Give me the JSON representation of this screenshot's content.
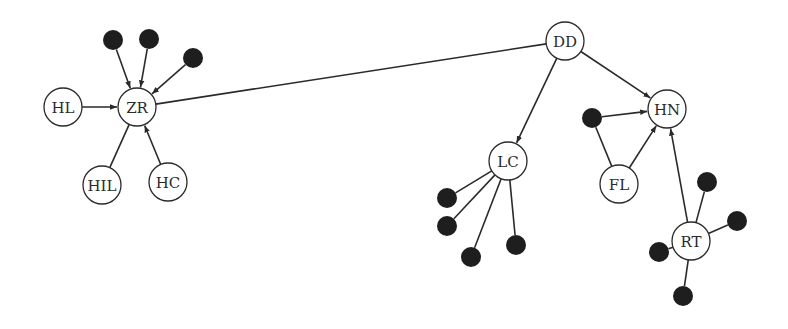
{
  "diagram": {
    "type": "network graph",
    "node_radius": 19,
    "dot_radius": 10,
    "colors": {
      "stroke": "#2a2a2a",
      "dot": "#1e1e1e",
      "background": "#ffffff"
    },
    "labeled_nodes": [
      {
        "id": "ZR",
        "label": "ZR",
        "x": 137,
        "y": 107
      },
      {
        "id": "HL",
        "label": "HL",
        "x": 63,
        "y": 107
      },
      {
        "id": "HIL",
        "label": "HIL",
        "x": 102,
        "y": 185
      },
      {
        "id": "HC",
        "label": "HC",
        "x": 168,
        "y": 182
      },
      {
        "id": "DD",
        "label": "DD",
        "x": 565,
        "y": 41
      },
      {
        "id": "HN",
        "label": "HN",
        "x": 667,
        "y": 109
      },
      {
        "id": "LC",
        "label": "LC",
        "x": 508,
        "y": 161
      },
      {
        "id": "FL",
        "label": "FL",
        "x": 619,
        "y": 184
      },
      {
        "id": "RT",
        "label": "RT",
        "x": 691,
        "y": 241
      }
    ],
    "unlabeled_nodes": [
      {
        "id": "z1",
        "x": 113,
        "y": 40
      },
      {
        "id": "z2",
        "x": 149,
        "y": 39
      },
      {
        "id": "z3",
        "x": 193,
        "y": 58
      },
      {
        "id": "h1",
        "x": 592,
        "y": 118
      },
      {
        "id": "l1",
        "x": 447,
        "y": 198
      },
      {
        "id": "l2",
        "x": 447,
        "y": 226
      },
      {
        "id": "l3",
        "x": 471,
        "y": 257
      },
      {
        "id": "l4",
        "x": 516,
        "y": 245
      },
      {
        "id": "r1",
        "x": 707,
        "y": 182
      },
      {
        "id": "r2",
        "x": 737,
        "y": 221
      },
      {
        "id": "r3",
        "x": 659,
        "y": 252
      },
      {
        "id": "r4",
        "x": 683,
        "y": 296
      }
    ],
    "edges": [
      {
        "from": "z1",
        "to": "ZR",
        "directed": true
      },
      {
        "from": "z2",
        "to": "ZR",
        "directed": true
      },
      {
        "from": "z3",
        "to": "ZR",
        "directed": true
      },
      {
        "from": "HL",
        "to": "ZR",
        "directed": true
      },
      {
        "from": "HC",
        "to": "ZR",
        "directed": true
      },
      {
        "from": "HIL",
        "to": "ZR",
        "directed": false
      },
      {
        "from": "ZR",
        "to": "DD",
        "directed": false
      },
      {
        "from": "DD",
        "to": "LC",
        "directed": true
      },
      {
        "from": "DD",
        "to": "HN",
        "directed": true
      },
      {
        "from": "h1",
        "to": "HN",
        "directed": true
      },
      {
        "from": "FL",
        "to": "HN",
        "directed": true
      },
      {
        "from": "h1",
        "to": "FL",
        "directed": false
      },
      {
        "from": "RT",
        "to": "HN",
        "directed": true
      },
      {
        "from": "LC",
        "to": "l1",
        "directed": false
      },
      {
        "from": "LC",
        "to": "l2",
        "directed": false
      },
      {
        "from": "LC",
        "to": "l3",
        "directed": false
      },
      {
        "from": "LC",
        "to": "l4",
        "directed": false
      },
      {
        "from": "RT",
        "to": "r1",
        "directed": false
      },
      {
        "from": "RT",
        "to": "r2",
        "directed": false
      },
      {
        "from": "RT",
        "to": "r3",
        "directed": false
      },
      {
        "from": "RT",
        "to": "r4",
        "directed": false
      }
    ]
  }
}
